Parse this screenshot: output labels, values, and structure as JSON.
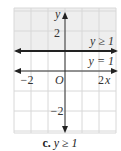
{
  "chart_data": {
    "type": "line",
    "title": "",
    "caption": {
      "letter": "c.",
      "text": "y ≥ 1"
    },
    "xlabel": "x",
    "ylabel": "y",
    "origin_label": "O",
    "xlim": [
      -3,
      3
    ],
    "ylim": [
      -3,
      3
    ],
    "x_ticks": [
      {
        "value": -2,
        "label": "−2"
      },
      {
        "value": 2,
        "label": "2"
      }
    ],
    "y_ticks": [
      {
        "value": 2,
        "label": "2"
      },
      {
        "value": -2,
        "label": "−2"
      }
    ],
    "grid": true,
    "series": [
      {
        "name": "boundary",
        "equation": "y = 1",
        "y": 1,
        "style": "solid"
      }
    ],
    "shaded_region": {
      "inequality": "y ≥ 1",
      "from_y": 1,
      "to_y": 3
    },
    "annotations": [
      {
        "text": "y ≥ 1",
        "x": 2,
        "y": 1.5
      },
      {
        "text": "y = 1",
        "x": 2,
        "y": 0.5
      }
    ],
    "colors": {
      "grid": "#d8d8d8",
      "shade": "#eeeeee",
      "axis": "#222222"
    }
  }
}
